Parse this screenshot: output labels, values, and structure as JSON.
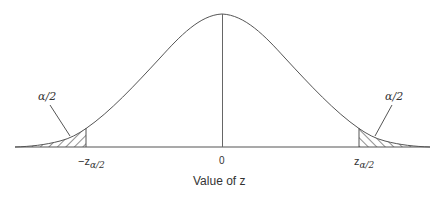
{
  "diagram": {
    "curve": "bell-shaped standard normal density",
    "left_tail": {
      "area_label": "α/2",
      "cutoff_prefix": "−z",
      "cutoff_subscript": "α/2",
      "shading": "hatched"
    },
    "right_tail": {
      "area_label": "α/2",
      "cutoff_prefix": "z",
      "cutoff_subscript": "α/2",
      "shading": "hatched"
    },
    "center_label": "0",
    "x_axis_label": "Value of z",
    "colors": {
      "line": "#555555",
      "hatch": "#444444",
      "background": "#ffffff"
    }
  }
}
